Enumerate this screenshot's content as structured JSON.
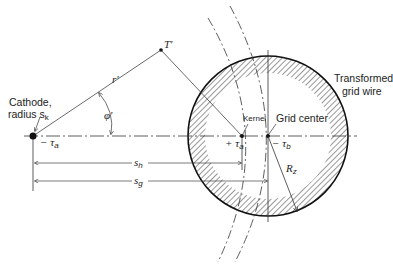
{
  "labels": {
    "cathode_line1": "Cathode,",
    "cathode_line2": "radius s",
    "cathode_sub": "k",
    "point_T": "T'",
    "radius_r": "r'",
    "angle_phi": "φ'",
    "neg_tau_a": "− τ",
    "neg_tau_a_sub": "a",
    "pos_tau_a": "+ τ",
    "pos_tau_a_sub": "a",
    "neg_tau_b": "− τ",
    "neg_tau_b_sub": "b",
    "kernel": "Kernel",
    "grid_center": "Grid center",
    "transformed_line1": "Transformed",
    "transformed_line2": "grid wire",
    "s_h": "s",
    "s_h_sub": "h",
    "s_g": "s",
    "s_g_sub": "g",
    "R_z": "R",
    "R_z_sub": "z"
  },
  "colors": {
    "ink": "#222222",
    "background": "#ffffff"
  }
}
